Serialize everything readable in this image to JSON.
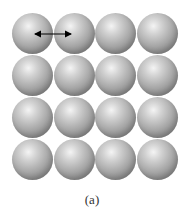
{
  "figure": {
    "caption": "(a)",
    "grid": {
      "rows": 4,
      "cols": 4,
      "element": "sphere"
    },
    "annotation": {
      "type": "double-headed-arrow",
      "from": "sphere-row1-col1-center",
      "to": "sphere-row1-col2-center"
    }
  },
  "colors": {
    "sphere_highlight": "#f4f4f4",
    "sphere_mid": "#a9a9a9",
    "sphere_shadow": "#6e6e6e",
    "arrow": "#000000",
    "background": "#ffffff"
  }
}
